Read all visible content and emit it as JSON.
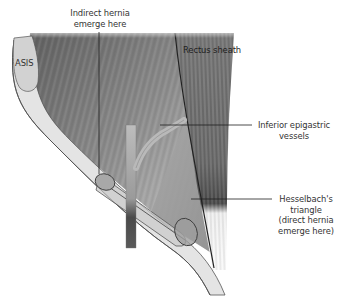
{
  "diagram": {
    "type": "anatomical-illustration",
    "colors": {
      "background": "#ffffff",
      "muscle_dark": "#6e6e6e",
      "muscle_light": "#c8c8c8",
      "rectus_dark": "#5a5a5a",
      "ligament_fill": "#e6e6e6",
      "outline": "#555555",
      "vessel_fill": "#b4b4b4",
      "cord_dark": "#4a4a4a",
      "label_text": "#333333",
      "leader_line": "#2a2a2a"
    }
  },
  "labels": {
    "indirect_hernia": {
      "line1": "Indirect hernia",
      "line2": "emerge here"
    },
    "asis": "ASIS",
    "rectus_sheath": "Rectus sheath",
    "inferior_epigastric": {
      "line1": "Inferior epigastric",
      "line2": "vessels"
    },
    "hesselbach": {
      "line1": "Hesselbach's",
      "line2": "triangle",
      "line3": "(direct hernia",
      "line4": "emerge here)"
    }
  }
}
